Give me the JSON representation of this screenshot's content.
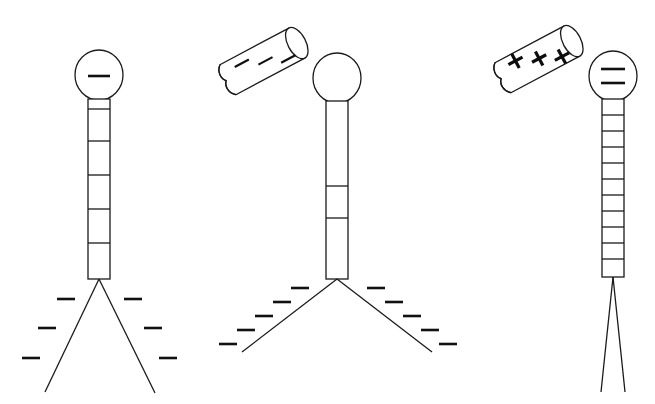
{
  "figure": {
    "background_color": "#ffffff",
    "line_color": "#1a1a1a",
    "mark_color": "#111111",
    "width": 655,
    "height": 404,
    "panel_count": 3
  },
  "panels": [
    {
      "id": "panel-1",
      "name": "negatively-charged-electroscope",
      "head": {
        "label": "-",
        "charge_symbol": "minus",
        "charge_count": 1,
        "cx": 99,
        "cy": 75,
        "rx": 24,
        "ry": 25
      },
      "stem": {
        "x": 88,
        "y": 99,
        "width": 22,
        "height": 180,
        "segments": 6
      },
      "legs": {
        "apex_x": 99,
        "apex_y": 279,
        "left_end_x": 45,
        "left_end_y": 392,
        "right_end_x": 155,
        "right_end_y": 393,
        "spread": "wide"
      },
      "leg_charges": {
        "symbol": "minus",
        "count": 6,
        "left": [
          {
            "x": 65,
            "y": 299
          },
          {
            "x": 46,
            "y": 328
          },
          {
            "x": 30,
            "y": 358
          }
        ],
        "right": [
          {
            "x": 131,
            "y": 299
          },
          {
            "x": 151,
            "y": 328
          },
          {
            "x": 166,
            "y": 358
          }
        ]
      },
      "rod": null
    },
    {
      "id": "panel-2",
      "name": "electroscope-with-negative-rod",
      "head": {
        "label": "",
        "charge_symbol": "none",
        "charge_count": 0,
        "cx": 337,
        "cy": 78,
        "rx": 24,
        "ry": 25
      },
      "stem": {
        "x": 326,
        "y": 101,
        "width": 22,
        "height": 178,
        "segments": 3
      },
      "legs": {
        "apex_x": 337,
        "apex_y": 279,
        "left_end_x": 242,
        "left_end_y": 352,
        "right_end_x": 432,
        "right_end_y": 352,
        "spread": "very-wide"
      },
      "leg_charges": {
        "symbol": "minus",
        "count": 10,
        "left": [
          {
            "x": 299,
            "y": 288
          },
          {
            "x": 281,
            "y": 302
          },
          {
            "x": 263,
            "y": 316
          },
          {
            "x": 245,
            "y": 330
          },
          {
            "x": 228,
            "y": 344
          }
        ],
        "right": [
          {
            "x": 375,
            "y": 288
          },
          {
            "x": 393,
            "y": 302
          },
          {
            "x": 411,
            "y": 316
          },
          {
            "x": 429,
            "y": 330
          },
          {
            "x": 447,
            "y": 344
          }
        ]
      },
      "rod": {
        "name": "negative-rod",
        "charge_symbol": "minus",
        "charge_count": 3,
        "angle_deg": -28,
        "cx": 265,
        "cy": 60,
        "length": 84,
        "thickness": 34,
        "labels": [
          "-",
          "-",
          "-"
        ]
      }
    },
    {
      "id": "panel-3",
      "name": "electroscope-with-positive-rod",
      "head": {
        "label": "=",
        "charge_symbol": "double-minus",
        "charge_count": 2,
        "cx": 613,
        "cy": 76,
        "rx": 24,
        "ry": 25
      },
      "stem": {
        "x": 602,
        "y": 99,
        "width": 22,
        "height": 178,
        "segments": 11
      },
      "legs": {
        "apex_x": 613,
        "apex_y": 277,
        "left_end_x": 601,
        "left_end_y": 392,
        "right_end_x": 625,
        "right_end_y": 392,
        "spread": "narrow"
      },
      "leg_charges": {
        "symbol": "none",
        "count": 0,
        "left": [],
        "right": []
      },
      "rod": {
        "name": "positive-rod",
        "charge_symbol": "plus",
        "charge_count": 3,
        "angle_deg": -28,
        "cx": 540,
        "cy": 58,
        "length": 84,
        "thickness": 34,
        "labels": [
          "+",
          "+",
          "+"
        ]
      }
    }
  ],
  "accessibility": {
    "description": "Three line drawings of an electroscope. Left: head marked with a minus sign, segmented stem, widely splayed legs surrounded by six minus signs. Middle: uncharged head, a rod bearing three minus signs held above and to the left, legs splayed very wide with ten minus signs. Right: head marked with a double minus (equals) sign, finely segmented stem, a rod bearing three plus signs held above and to the left, legs nearly closed with no charge marks."
  }
}
